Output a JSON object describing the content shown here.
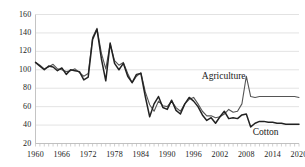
{
  "chart_data": {
    "type": "line",
    "title": "",
    "xlabel": "",
    "ylabel": "",
    "xlim": [
      1960,
      2020
    ],
    "ylim": [
      20,
      160
    ],
    "grid": true,
    "grid_axis": "y",
    "legend": "inline-annotations",
    "y_ticks": [
      20,
      40,
      60,
      80,
      100,
      120,
      140,
      160
    ],
    "x_ticks": [
      1960,
      1966,
      1972,
      1978,
      1984,
      1990,
      1996,
      2002,
      2008,
      2014,
      2020
    ],
    "x_minor_tick_interval": 1,
    "x": [
      1960,
      1961,
      1962,
      1963,
      1964,
      1965,
      1966,
      1967,
      1968,
      1969,
      1970,
      1971,
      1972,
      1973,
      1974,
      1975,
      1976,
      1977,
      1978,
      1979,
      1980,
      1981,
      1982,
      1983,
      1984,
      1985,
      1986,
      1987,
      1988,
      1989,
      1990,
      1991,
      1992,
      1993,
      1994,
      1995,
      1996,
      1997,
      1998,
      1999,
      2000,
      2001,
      2002,
      2003,
      2004,
      2005,
      2006,
      2007,
      2008,
      2009,
      2010,
      2011,
      2012,
      2013,
      2014,
      2015,
      2016,
      2017,
      2018,
      2019,
      2020
    ],
    "series": [
      {
        "name": "Agriculture",
        "color": "#555555",
        "annotation": "Agriculture",
        "values": [
          108,
          105,
          101,
          103,
          106,
          101,
          100,
          98,
          99,
          101,
          97,
          93,
          96,
          135,
          145,
          118,
          101,
          128,
          110,
          105,
          108,
          96,
          86,
          93,
          97,
          76,
          62,
          55,
          66,
          61,
          60,
          66,
          59,
          55,
          63,
          68,
          70,
          63,
          55,
          50,
          50,
          48,
          49,
          52,
          57,
          54,
          55,
          63,
          93,
          71,
          70,
          71,
          71,
          71,
          71,
          71,
          71,
          71,
          71,
          71,
          70
        ]
      },
      {
        "name": "Cotton",
        "color": "#222222",
        "annotation": "Cotton",
        "values": [
          108,
          104,
          100,
          104,
          103,
          99,
          102,
          95,
          100,
          99,
          98,
          89,
          92,
          133,
          144,
          112,
          88,
          129,
          107,
          100,
          107,
          93,
          86,
          95,
          96,
          71,
          49,
          63,
          71,
          59,
          57,
          67,
          56,
          52,
          63,
          70,
          66,
          60,
          51,
          45,
          48,
          42,
          49,
          55,
          47,
          48,
          47,
          51,
          52,
          38,
          42,
          44,
          44,
          43,
          43,
          42,
          42,
          41,
          41,
          41,
          41
        ]
      }
    ]
  },
  "annotations": {
    "agriculture_label": "Agriculture",
    "cotton_label": "Cotton"
  },
  "colors": {
    "agriculture": "#555555",
    "cotton": "#222222",
    "grid": "#d6d6d6",
    "axis": "#bdbdbd",
    "text": "#1a1a1a"
  }
}
